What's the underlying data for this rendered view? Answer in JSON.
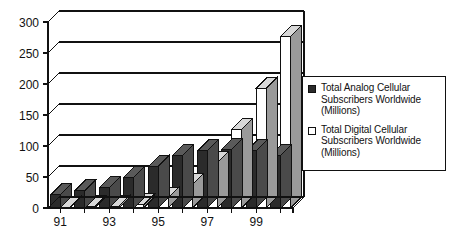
{
  "chart_data": {
    "type": "bar",
    "title": "",
    "subtitle": "",
    "xlabel": "",
    "ylabel": "",
    "xlim_categories": [
      "91",
      "92",
      "93",
      "94",
      "95",
      "96",
      "97",
      "98",
      "99",
      "00"
    ],
    "categories": [
      "91",
      "92",
      "93",
      "94",
      "95",
      "96",
      "97",
      "98",
      "99",
      "00"
    ],
    "xtick_labels": [
      "91",
      "",
      "93",
      "",
      "95",
      "",
      "97",
      "",
      "99",
      ""
    ],
    "ylim": [
      0,
      300
    ],
    "yticks": [
      0,
      50,
      100,
      150,
      200,
      250,
      300
    ],
    "ytick_labels": [
      "0",
      "50",
      "100",
      "150",
      "200",
      "250",
      "300"
    ],
    "grid": true,
    "grid_axis": "y",
    "legend_position": "right",
    "three_d": true,
    "series": [
      {
        "name": "Total Analog Cellular Subscribers Worldwide (Millions)",
        "short_name": "Total Analog Cellular",
        "color": "#2b2b2b",
        "values": [
          21,
          28,
          33,
          50,
          67,
          85,
          92,
          95,
          92,
          85
        ]
      },
      {
        "name": "Total Digital Cellular Subscribers Worldwide (Millions)",
        "short_name": "Total Digital Cellular",
        "color": "#ffffff",
        "values": [
          1,
          2,
          3,
          5,
          16,
          38,
          73,
          127,
          193,
          277
        ]
      }
    ]
  },
  "legend": {
    "entries": [
      {
        "swatch": "filled-dark-square",
        "line1": "Total Analog Cellular",
        "line2": "Subscribers Worldwide",
        "line3": "(Millions)"
      },
      {
        "swatch": "empty-white-square",
        "line1": "Total Digital Cellular",
        "line2": "Subscribers Worldwide",
        "line3": "(Millions)"
      }
    ]
  },
  "colors": {
    "analog_front": "#2b2b2b",
    "analog_top": "#5a5a5a",
    "analog_side": "#4a4a4a",
    "digital_front": "#ffffff",
    "digital_top": "#d8d8d8",
    "digital_side": "#9a9a9a",
    "axis": "#111111",
    "grid": "#111111",
    "background": "#ffffff"
  }
}
